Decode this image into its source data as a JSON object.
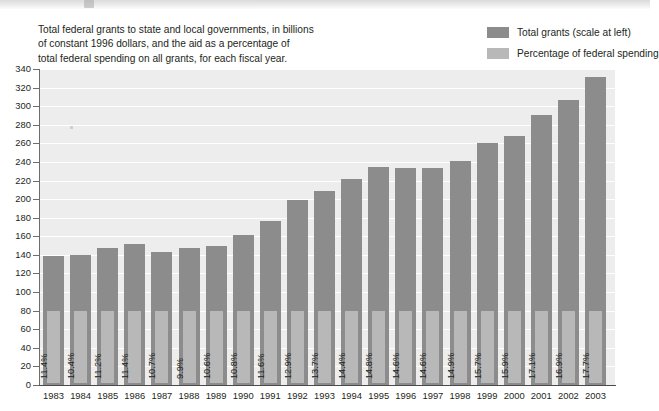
{
  "caption": {
    "line1": "Total federal grants to state and local governments, in billions",
    "line2": "of constant 1996 dollars, and the aid as a percentage of",
    "line3": "total federal spending on all grants, for each fiscal year."
  },
  "legend": {
    "position": "top-right",
    "items": [
      {
        "label": "Total grants (scale at left)",
        "color": "#8c8c8c",
        "swatch_name": "legend-swatch-total-grants"
      },
      {
        "label": "Percentage of federal spending",
        "color": "#b8b8b8",
        "swatch_name": "legend-swatch-percentage"
      }
    ]
  },
  "colors": {
    "bar_dark": "#8c8c8c",
    "bar_light": "#b8b8b8",
    "plot_background": "#ededed",
    "gridline": "#ffffff",
    "axis": "#6d6d6d",
    "text": "#231f20"
  },
  "chart_data": {
    "type": "bar",
    "title": "",
    "subtitle": "",
    "xlabel": "",
    "ylabel": "",
    "ylim": [
      0,
      340
    ],
    "ytick_step": 20,
    "grid": true,
    "legend_position": "top-right",
    "categories": [
      "1983",
      "1984",
      "1985",
      "1986",
      "1987",
      "1988",
      "1989",
      "1990",
      "1991",
      "1992",
      "1993",
      "1994",
      "1995",
      "1996",
      "1997",
      "1998",
      "1999",
      "2000",
      "2001",
      "2002",
      "2003"
    ],
    "yticks": [
      0,
      20,
      40,
      60,
      80,
      100,
      120,
      140,
      160,
      180,
      200,
      220,
      240,
      260,
      280,
      300,
      320,
      340
    ],
    "series": [
      {
        "name": "Total grants (scale at left)",
        "unit": "billions of constant 1996 dollars",
        "values": [
          139,
          140,
          147,
          152,
          143,
          147,
          150,
          161,
          176,
          199,
          209,
          222,
          235,
          233,
          234,
          241,
          260,
          268,
          290,
          307,
          331
        ]
      },
      {
        "name": "Percentage of federal spending",
        "unit": "percent",
        "values": [
          11.4,
          10.4,
          11.2,
          11.4,
          10.7,
          9.9,
          10.6,
          10.8,
          11.6,
          12.9,
          13.7,
          14.4,
          14.8,
          14.6,
          14.6,
          14.9,
          15.7,
          15.9,
          17.1,
          16.9,
          17.7
        ],
        "labels": [
          "11.4%",
          "10.4%",
          "11.2%",
          "11.4%",
          "10.7%",
          "9.9%",
          "10.6%",
          "10.8%",
          "11.6%",
          "12.9%",
          "13.7%",
          "14.4%",
          "14.8%",
          "14.6%",
          "14.6%",
          "14.9%",
          "15.7%",
          "15.9%",
          "17.1%",
          "16.9%",
          "17.7%"
        ]
      }
    ]
  }
}
